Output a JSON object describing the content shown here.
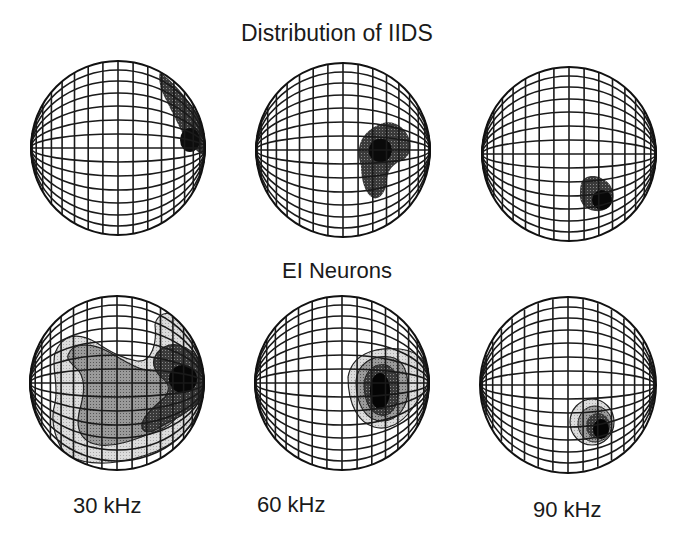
{
  "figure": {
    "title_top": "Distribution of IIDS",
    "title_bottom": "EI Neurons",
    "frequencies": [
      "30 kHz",
      "60 kHz",
      "90 kHz"
    ]
  },
  "rows": [
    {
      "name": "Distribution of IIDS",
      "panels": [
        {
          "frequency": "30 kHz",
          "description": "dark region along upper-right limb of globe"
        },
        {
          "frequency": "60 kHz",
          "description": "dark polygonal region right of center with black core"
        },
        {
          "frequency": "90 kHz",
          "description": "small dark region lower-right of center with black core"
        }
      ]
    },
    {
      "name": "EI Neurons",
      "panels": [
        {
          "frequency": "30 kHz",
          "description": "broad multi-level contours covering most of globe, darkest at right edge"
        },
        {
          "frequency": "60 kHz",
          "description": "nested contours right of center, black core"
        },
        {
          "frequency": "90 kHz",
          "description": "small nested contours lower-right of center, black core"
        }
      ]
    }
  ],
  "shading_levels": {
    "light": "#d6d6d6",
    "medium": "#8e8e8e",
    "dark": "#4a4a4a",
    "darkest": "#111111"
  },
  "globes": [
    {
      "id": "iids-30",
      "cx": 118,
      "cy": 148,
      "r": 87
    },
    {
      "id": "iids-60",
      "cx": 343,
      "cy": 150,
      "r": 87
    },
    {
      "id": "iids-90",
      "cx": 569,
      "cy": 154,
      "r": 87
    },
    {
      "id": "ei-30",
      "cx": 117,
      "cy": 383,
      "r": 87
    },
    {
      "id": "ei-60",
      "cx": 342,
      "cy": 383,
      "r": 87
    },
    {
      "id": "ei-90",
      "cx": 568,
      "cy": 385,
      "r": 88
    }
  ]
}
